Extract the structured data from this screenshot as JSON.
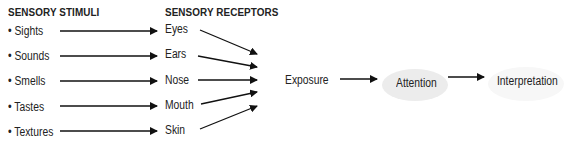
{
  "headers": {
    "stimuli": "SENSORY STIMULI",
    "receptors": "SENSORY RECEPTORS"
  },
  "stimuli": [
    {
      "bullet": "•",
      "label": "Sights"
    },
    {
      "bullet": "•",
      "label": "Sounds"
    },
    {
      "bullet": "•",
      "label": "Smells"
    },
    {
      "bullet": "•",
      "label": "Tastes"
    },
    {
      "bullet": "•",
      "label": "Textures"
    }
  ],
  "receptors": [
    "Eyes",
    "Ears",
    "Nose",
    "Mouth",
    "Skin"
  ],
  "process": {
    "exposure": "Exposure",
    "attention": "Attention",
    "interpretation": "Interpretation"
  },
  "colors": {
    "arrow": "#111111",
    "attention_fill": "#ececec",
    "interpretation_fill": "#f6f6f6"
  }
}
